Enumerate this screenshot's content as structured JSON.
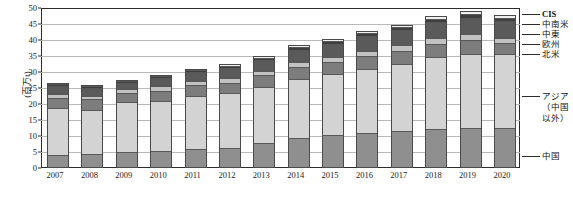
{
  "chart_data": {
    "type": "bar",
    "stacked": true,
    "title": "",
    "xlabel": "",
    "ylabel": "(百万t)",
    "ylim": [
      0,
      50
    ],
    "ytick_step": 5,
    "grid": true,
    "legend_position": "right",
    "categories": [
      "2007",
      "2008",
      "2009",
      "2010",
      "2011",
      "2012",
      "2013",
      "2014",
      "2015",
      "2016",
      "2017",
      "2018",
      "2019",
      "2020"
    ],
    "ytick_labels": [
      "0",
      "5",
      "10",
      "15",
      "20",
      "25",
      "30",
      "35",
      "40",
      "45",
      "50"
    ],
    "series": [
      {
        "name": "中国",
        "color": "#8f8f8f",
        "values": [
          3.4,
          3.8,
          4.5,
          4.8,
          5.3,
          5.6,
          7.2,
          8.9,
          9.8,
          10.4,
          10.9,
          11.5,
          11.8,
          12.0
        ]
      },
      {
        "name": "アジア（中国以外）",
        "color": "#d3d3d3",
        "values": [
          14.7,
          13.7,
          15.4,
          15.5,
          16.5,
          17.1,
          17.5,
          18.3,
          18.8,
          20.0,
          21.0,
          22.5,
          23.3,
          23.0
        ]
      },
      {
        "name": "北米",
        "color": "#7d7d7d",
        "values": [
          3.1,
          3.3,
          2.9,
          3.3,
          3.4,
          3.4,
          3.6,
          3.8,
          3.9,
          4.0,
          4.1,
          4.2,
          4.3,
          3.4
        ]
      },
      {
        "name": "欧州",
        "color": "#c2c2c2",
        "values": [
          1.3,
          1.2,
          1.2,
          1.4,
          1.4,
          1.4,
          1.5,
          1.6,
          1.7,
          1.7,
          1.8,
          1.9,
          1.9,
          1.7
        ]
      },
      {
        "name": "中東",
        "color": "#5a5a5a",
        "values": [
          2.4,
          2.3,
          2.0,
          2.5,
          2.7,
          3.1,
          3.3,
          3.7,
          4.0,
          4.4,
          4.6,
          4.9,
          5.1,
          5.2
        ]
      },
      {
        "name": "中南米",
        "color": "#3f3f3f",
        "values": [
          0.6,
          0.6,
          0.6,
          0.7,
          0.7,
          0.8,
          0.8,
          0.9,
          0.9,
          1.0,
          1.0,
          1.1,
          1.1,
          1.0
        ]
      },
      {
        "name": "CIS",
        "color": "#efefef",
        "values": [
          0.4,
          0.4,
          0.4,
          0.4,
          0.4,
          0.4,
          0.5,
          0.5,
          0.6,
          0.6,
          0.7,
          0.8,
          0.9,
          1.0
        ]
      }
    ],
    "totals": [
      25.9,
      25.3,
      27.0,
      28.6,
      30.4,
      31.8,
      34.4,
      37.7,
      39.7,
      42.1,
      44.1,
      46.9,
      48.4,
      47.3
    ]
  },
  "legend": {
    "entries": [
      {
        "label": "CIS"
      },
      {
        "label": "中南米"
      },
      {
        "label": "中東"
      },
      {
        "label": "欧州"
      },
      {
        "label": "北米"
      },
      {
        "label": "アジア"
      },
      {
        "label": "（中国"
      },
      {
        "label": "以外）"
      },
      {
        "label": "中国"
      }
    ]
  }
}
